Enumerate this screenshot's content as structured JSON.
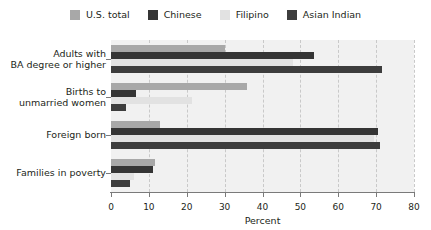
{
  "chart_data": {
    "type": "bar",
    "orientation": "horizontal",
    "title": "",
    "xlabel": "Percent",
    "ylabel": "",
    "xlim": [
      0,
      80
    ],
    "xticks": [
      0,
      10,
      20,
      30,
      40,
      50,
      60,
      70,
      80
    ],
    "grid": "vertical-dashed",
    "legend_position": "top-center",
    "categories": [
      "Adults with\nBA degree or higher",
      "Births to\nunmarried women",
      "Foreign born",
      "Families in poverty"
    ],
    "series": [
      {
        "name": "U.S. total",
        "color": "#a8a8a8",
        "values": [
          30,
          36,
          13,
          11.5
        ]
      },
      {
        "name": "Chinese",
        "color": "#353535",
        "values": [
          53.5,
          6.5,
          70.5,
          11
        ]
      },
      {
        "name": "Filipino",
        "color": "#e2e2e2",
        "values": [
          48,
          21.5,
          69.5,
          6
        ]
      },
      {
        "name": "Asian Indian",
        "color": "#3d3d3d",
        "values": [
          71.5,
          4,
          71,
          5
        ]
      }
    ]
  },
  "axis": {
    "tick_labels": [
      "0",
      "10",
      "20",
      "30",
      "40",
      "50",
      "60",
      "70",
      "80"
    ],
    "xlabel": "Percent"
  },
  "legend": {
    "items": [
      {
        "label": "U.S. total",
        "color": "#a8a8a8"
      },
      {
        "label": "Chinese",
        "color": "#353535"
      },
      {
        "label": "Filipino",
        "color": "#e2e2e2"
      },
      {
        "label": "Asian Indian",
        "color": "#3d3d3d"
      }
    ]
  },
  "categories": [
    {
      "line1": "Adults with",
      "line2": "BA degree or higher"
    },
    {
      "line1": "Births to",
      "line2": "unmarried women"
    },
    {
      "line1": "Foreign born",
      "line2": ""
    },
    {
      "line1": "Families in poverty",
      "line2": ""
    }
  ]
}
